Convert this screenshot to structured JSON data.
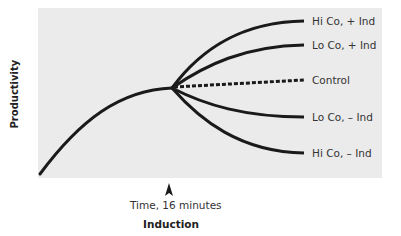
{
  "diagram": {
    "y_axis_label": "Productivity",
    "x_axis_label": "Induction",
    "induction_marker_label": "Time, 16 minutes",
    "induction_marker_icon": "arrow-up-icon",
    "colors": {
      "plot_background": "#ebebeb",
      "page_background": "#ffffff",
      "line": "#1a1a1a",
      "text": "#333333"
    },
    "series": [
      {
        "name": "Hi Co, + Ind",
        "style": "solid",
        "end_y_rank": 1
      },
      {
        "name": "Lo Co, + Ind",
        "style": "solid",
        "end_y_rank": 2
      },
      {
        "name": "Control",
        "style": "dashed",
        "end_y_rank": 3
      },
      {
        "name": "Lo Co, – Ind",
        "style": "solid",
        "end_y_rank": 4
      },
      {
        "name": "Hi Co, – Ind",
        "style": "solid",
        "end_y_rank": 5
      }
    ],
    "pre_induction_curve": "rising, decelerating growth from origin to induction point"
  }
}
